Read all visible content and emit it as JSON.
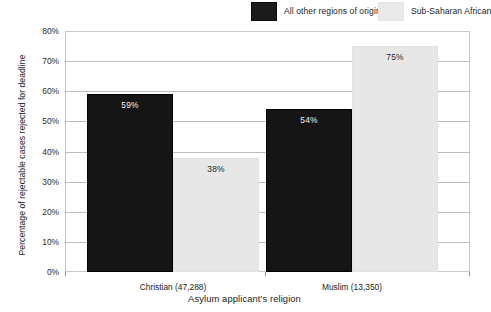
{
  "chart_data": {
    "type": "bar",
    "title": "",
    "xlabel": "Asylum applicant's religion",
    "ylabel": "Percentage of rejectable cases rejected for deadline",
    "categories": [
      "Christian (47,288)",
      "Muslim (13,350)"
    ],
    "series": [
      {
        "name": "All other regions of origin",
        "color": "#151515",
        "values": [
          59,
          54
        ],
        "labels": [
          "59%",
          "54%"
        ]
      },
      {
        "name": "Sub-Saharan African",
        "color": "#e7e7e7",
        "values": [
          38,
          75
        ],
        "labels": [
          "38%",
          "75%"
        ]
      }
    ],
    "ylim": [
      0,
      80
    ],
    "ytick_values": [
      80,
      70,
      60,
      50,
      40,
      30,
      20,
      10,
      0
    ],
    "ytick_labels": [
      "80%",
      "70%",
      "60%",
      "50%",
      "40%",
      "30%",
      "20%",
      "10%",
      "0%"
    ],
    "grid": true,
    "legend_position": "top-right"
  },
  "legend": {
    "entries": [
      {
        "label": "All other regions of origin",
        "swatch": "dark-swatch"
      },
      {
        "label": "Sub-Saharan African",
        "swatch": "light-swatch"
      }
    ]
  },
  "axes": {
    "y_title": "Percentage of rejectable cases rejected for deadline",
    "x_title": "Asylum applicant's religion"
  }
}
